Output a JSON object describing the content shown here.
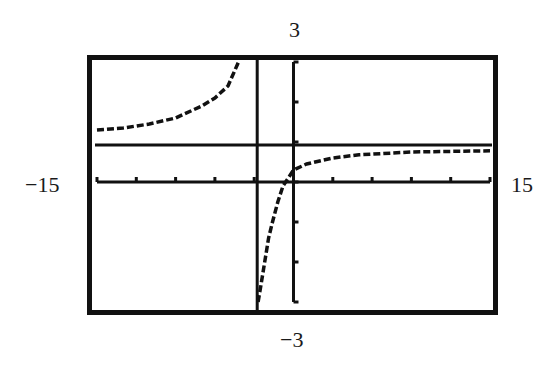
{
  "window_labels": {
    "ymax": "3",
    "ymin": "−3",
    "xmin": "−15",
    "xmax": "15"
  },
  "colors": {
    "ink": "#111111",
    "background": "#ffffff"
  },
  "chart_data": {
    "type": "line",
    "title": "",
    "xlabel": "",
    "ylabel": "",
    "xlim": [
      -15,
      15
    ],
    "ylim": [
      -3,
      3
    ],
    "x_tick_spacing": 3,
    "y_tick_spacing": 1,
    "grid": false,
    "legend": null,
    "frame": "thick black graphing-calculator window border",
    "annotations": [
      {
        "type": "window-label",
        "position": "top",
        "text": "3"
      },
      {
        "type": "window-label",
        "position": "bottom",
        "text": "−3"
      },
      {
        "type": "window-label",
        "position": "left",
        "text": "−15"
      },
      {
        "type": "window-label",
        "position": "right",
        "text": "15"
      }
    ],
    "asymptotes": {
      "vertical": {
        "x": -3,
        "drawn": true
      },
      "horizontal": {
        "y": 1,
        "drawn": true
      }
    },
    "series": [
      {
        "name": "left branch",
        "points": [
          [
            -15,
            1.3
          ],
          [
            -13,
            1.35
          ],
          [
            -11,
            1.45
          ],
          [
            -9,
            1.6
          ],
          [
            -7,
            1.9
          ],
          [
            -6,
            2.1
          ],
          [
            -5,
            2.4
          ],
          [
            -4.2,
            3.0
          ]
        ]
      },
      {
        "name": "right branch",
        "points": [
          [
            -2.7,
            -3.0
          ],
          [
            -2.5,
            -2.6
          ],
          [
            -2.2,
            -2.0
          ],
          [
            -1.9,
            -1.4
          ],
          [
            -1.6,
            -1.0
          ],
          [
            -1.2,
            -0.5
          ],
          [
            -0.8,
            -0.1
          ],
          [
            0,
            0.3
          ],
          [
            1,
            0.45
          ],
          [
            3,
            0.6
          ],
          [
            5,
            0.68
          ],
          [
            9,
            0.75
          ],
          [
            15,
            0.78
          ]
        ]
      }
    ]
  }
}
